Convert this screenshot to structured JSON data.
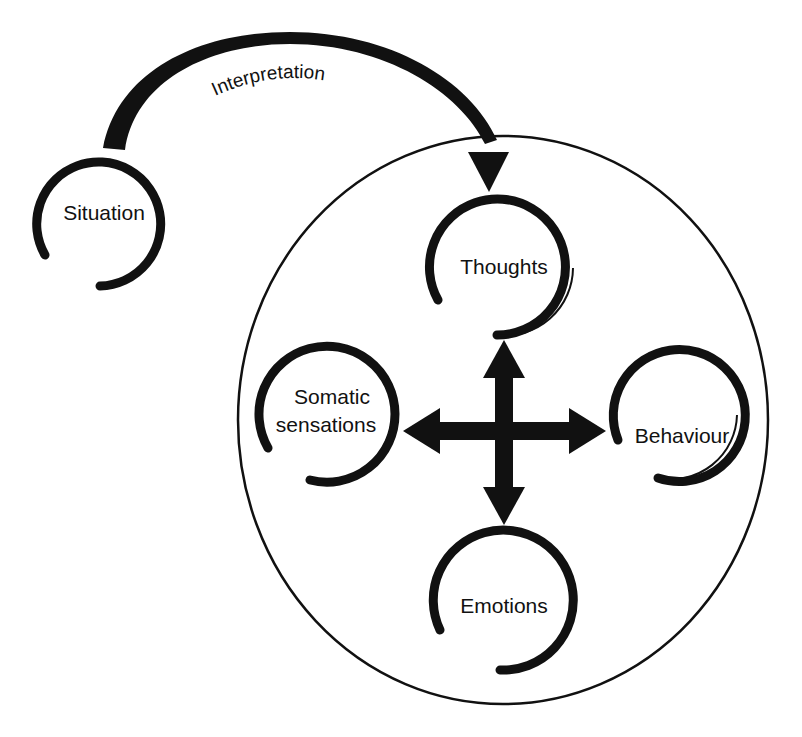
{
  "diagram": {
    "type": "cognitive-behavioural-model",
    "colors": {
      "ink": "#111111",
      "background": "#ffffff"
    },
    "top_arc_label": "Interpretation",
    "nodes": {
      "situation": {
        "label": "Situation"
      },
      "thoughts": {
        "label": "Thoughts"
      },
      "somatic": {
        "label_line1": "Somatic",
        "label_line2": "sensations"
      },
      "behaviour": {
        "label": "Behaviour"
      },
      "emotions": {
        "label": "Emotions"
      }
    },
    "edges": [
      {
        "from": "Situation",
        "to": "Thoughts",
        "label": "Interpretation",
        "direction": "one-way"
      },
      {
        "between": [
          "Thoughts",
          "Emotions",
          "Somatic sensations",
          "Behaviour"
        ],
        "style": "four-way cross arrow",
        "direction": "bidirectional"
      }
    ],
    "container": {
      "shape": "circle",
      "contains": [
        "Thoughts",
        "Somatic sensations",
        "Behaviour",
        "Emotions"
      ]
    }
  }
}
